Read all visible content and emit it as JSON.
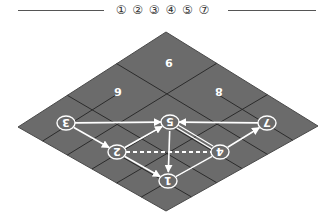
{
  "legend": {
    "text": "① ② ③ ④ ⑤ ⑦",
    "items": [
      "1",
      "2",
      "3",
      "4",
      "5",
      "7"
    ]
  },
  "board": {
    "fill": "#6b6b6b",
    "grid_color": "#2b2b2b",
    "vertices": {
      "top": [
        166,
        32
      ],
      "right": [
        318,
        126
      ],
      "bottom": [
        166,
        211
      ],
      "left": [
        18,
        127
      ]
    },
    "grid_size": 6
  },
  "tiles": [
    {
      "label": "9",
      "x": 169,
      "y": 63
    },
    {
      "label": "6",
      "x": 118,
      "y": 92
    },
    {
      "label": "8",
      "x": 219,
      "y": 92
    }
  ],
  "nodes": [
    {
      "id": "1",
      "x": 168,
      "y": 181
    },
    {
      "id": "2",
      "x": 117,
      "y": 152
    },
    {
      "id": "3",
      "x": 66,
      "y": 123
    },
    {
      "id": "4",
      "x": 220,
      "y": 152
    },
    {
      "id": "5",
      "x": 170,
      "y": 122
    },
    {
      "id": "7",
      "x": 267,
      "y": 123
    }
  ],
  "edges": [
    {
      "from": "3",
      "to": "5",
      "style": "solid",
      "arrow": "to"
    },
    {
      "from": "7",
      "to": "5",
      "style": "solid",
      "arrow": "to"
    },
    {
      "from": "3",
      "to": "2",
      "style": "solid",
      "arrow": "to"
    },
    {
      "from": "2",
      "to": "5",
      "style": "solid",
      "arrow": "to"
    },
    {
      "from": "2",
      "to": "1",
      "style": "solid",
      "arrow": "to"
    },
    {
      "from": "5",
      "to": "1",
      "style": "solid",
      "arrow": "to"
    },
    {
      "from": "5",
      "to": "4",
      "style": "double",
      "arrow": "none"
    },
    {
      "from": "4",
      "to": "7",
      "style": "solid",
      "arrow": "to"
    },
    {
      "from": "4",
      "to": "1",
      "style": "solid",
      "arrow": "none"
    },
    {
      "from": "2",
      "to": "4",
      "style": "dashed",
      "arrow": "none"
    }
  ]
}
